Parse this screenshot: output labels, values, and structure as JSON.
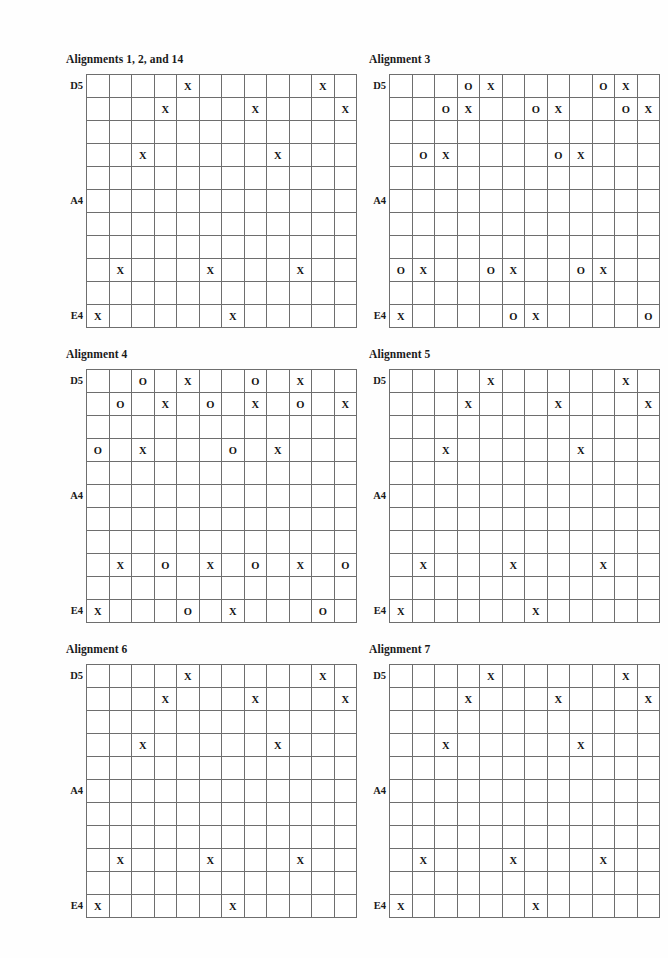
{
  "page": {
    "background_color": "#fefefe",
    "grid_line_color": "#6e6e6e",
    "text_color": "#131313",
    "columns": 12,
    "rows": 11
  },
  "row_labels": [
    {
      "text": "D5",
      "row": 0
    },
    {
      "text": "A4",
      "row": 5
    },
    {
      "text": "E4",
      "row": 10
    }
  ],
  "panels": [
    {
      "title": "Alignments 1, 2, and 14",
      "cells": [
        [
          "",
          "",
          "",
          "",
          "X",
          "",
          "",
          "",
          "",
          "",
          "X",
          ""
        ],
        [
          "",
          "",
          "",
          "X",
          "",
          "",
          "",
          "X",
          "",
          "",
          "",
          "X"
        ],
        [
          "",
          "",
          "",
          "",
          "",
          "",
          "",
          "",
          "",
          "",
          "",
          ""
        ],
        [
          "",
          "",
          "X",
          "",
          "",
          "",
          "",
          "",
          "X",
          "",
          "",
          ""
        ],
        [
          "",
          "",
          "",
          "",
          "",
          "",
          "",
          "",
          "",
          "",
          "",
          ""
        ],
        [
          "",
          "",
          "",
          "",
          "",
          "",
          "",
          "",
          "",
          "",
          "",
          ""
        ],
        [
          "",
          "",
          "",
          "",
          "",
          "",
          "",
          "",
          "",
          "",
          "",
          ""
        ],
        [
          "",
          "",
          "",
          "",
          "",
          "",
          "",
          "",
          "",
          "",
          "",
          ""
        ],
        [
          "",
          "X",
          "",
          "",
          "",
          "X",
          "",
          "",
          "",
          "X",
          "",
          ""
        ],
        [
          "",
          "",
          "",
          "",
          "",
          "",
          "",
          "",
          "",
          "",
          "",
          ""
        ],
        [
          "X",
          "",
          "",
          "",
          "",
          "",
          "X",
          "",
          "",
          "",
          "",
          ""
        ]
      ]
    },
    {
      "title": "Alignment 3",
      "cells": [
        [
          "",
          "",
          "",
          "O",
          "X",
          "",
          "",
          "",
          "",
          "O",
          "X",
          ""
        ],
        [
          "",
          "",
          "O",
          "X",
          "",
          "",
          "O",
          "X",
          "",
          "",
          "O",
          "X"
        ],
        [
          "",
          "",
          "",
          "",
          "",
          "",
          "",
          "",
          "",
          "",
          "",
          ""
        ],
        [
          "",
          "O",
          "X",
          "",
          "",
          "",
          "",
          "O",
          "X",
          "",
          "",
          ""
        ],
        [
          "",
          "",
          "",
          "",
          "",
          "",
          "",
          "",
          "",
          "",
          "",
          ""
        ],
        [
          "",
          "",
          "",
          "",
          "",
          "",
          "",
          "",
          "",
          "",
          "",
          ""
        ],
        [
          "",
          "",
          "",
          "",
          "",
          "",
          "",
          "",
          "",
          "",
          "",
          ""
        ],
        [
          "",
          "",
          "",
          "",
          "",
          "",
          "",
          "",
          "",
          "",
          "",
          ""
        ],
        [
          "O",
          "X",
          "",
          "",
          "O",
          "X",
          "",
          "",
          "O",
          "X",
          "",
          ""
        ],
        [
          "",
          "",
          "",
          "",
          "",
          "",
          "",
          "",
          "",
          "",
          "",
          ""
        ],
        [
          "X",
          "",
          "",
          "",
          "",
          "O",
          "X",
          "",
          "",
          "",
          "",
          "O"
        ]
      ]
    },
    {
      "title": "Alignment 4",
      "cells": [
        [
          "",
          "",
          "O",
          "",
          "X",
          "",
          "",
          "O",
          "",
          "X",
          "",
          ""
        ],
        [
          "",
          "O",
          "",
          "X",
          "",
          "O",
          "",
          "X",
          "",
          "O",
          "",
          "X"
        ],
        [
          "",
          "",
          "",
          "",
          "",
          "",
          "",
          "",
          "",
          "",
          "",
          ""
        ],
        [
          "O",
          "",
          "X",
          "",
          "",
          "",
          "O",
          "",
          "X",
          "",
          "",
          ""
        ],
        [
          "",
          "",
          "",
          "",
          "",
          "",
          "",
          "",
          "",
          "",
          "",
          ""
        ],
        [
          "",
          "",
          "",
          "",
          "",
          "",
          "",
          "",
          "",
          "",
          "",
          ""
        ],
        [
          "",
          "",
          "",
          "",
          "",
          "",
          "",
          "",
          "",
          "",
          "",
          ""
        ],
        [
          "",
          "",
          "",
          "",
          "",
          "",
          "",
          "",
          "",
          "",
          "",
          ""
        ],
        [
          "",
          "X",
          "",
          "O",
          "",
          "X",
          "",
          "O",
          "",
          "X",
          "",
          "O"
        ],
        [
          "",
          "",
          "",
          "",
          "",
          "",
          "",
          "",
          "",
          "",
          "",
          ""
        ],
        [
          "X",
          "",
          "",
          "",
          "O",
          "",
          "X",
          "",
          "",
          "",
          "O",
          ""
        ]
      ]
    },
    {
      "title": "Alignment 5",
      "cells": [
        [
          "",
          "",
          "",
          "",
          "X",
          "",
          "",
          "",
          "",
          "",
          "X",
          ""
        ],
        [
          "",
          "",
          "",
          "X",
          "",
          "",
          "",
          "X",
          "",
          "",
          "",
          "X"
        ],
        [
          "",
          "",
          "",
          "",
          "",
          "",
          "",
          "",
          "",
          "",
          "",
          ""
        ],
        [
          "",
          "",
          "X",
          "",
          "",
          "",
          "",
          "",
          "X",
          "",
          "",
          ""
        ],
        [
          "",
          "",
          "",
          "",
          "",
          "",
          "",
          "",
          "",
          "",
          "",
          ""
        ],
        [
          "",
          "",
          "",
          "",
          "",
          "",
          "",
          "",
          "",
          "",
          "",
          ""
        ],
        [
          "",
          "",
          "",
          "",
          "",
          "",
          "",
          "",
          "",
          "",
          "",
          ""
        ],
        [
          "",
          "",
          "",
          "",
          "",
          "",
          "",
          "",
          "",
          "",
          "",
          ""
        ],
        [
          "",
          "X",
          "",
          "",
          "",
          "X",
          "",
          "",
          "",
          "X",
          "",
          ""
        ],
        [
          "",
          "",
          "",
          "",
          "",
          "",
          "",
          "",
          "",
          "",
          "",
          ""
        ],
        [
          "X",
          "",
          "",
          "",
          "",
          "",
          "X",
          "",
          "",
          "",
          "",
          ""
        ]
      ]
    },
    {
      "title": "Alignment 6",
      "cells": [
        [
          "",
          "",
          "",
          "",
          "X",
          "",
          "",
          "",
          "",
          "",
          "X",
          ""
        ],
        [
          "",
          "",
          "",
          "X",
          "",
          "",
          "",
          "X",
          "",
          "",
          "",
          "X"
        ],
        [
          "",
          "",
          "",
          "",
          "",
          "",
          "",
          "",
          "",
          "",
          "",
          ""
        ],
        [
          "",
          "",
          "X",
          "",
          "",
          "",
          "",
          "",
          "X",
          "",
          "",
          ""
        ],
        [
          "",
          "",
          "",
          "",
          "",
          "",
          "",
          "",
          "",
          "",
          "",
          ""
        ],
        [
          "",
          "",
          "",
          "",
          "",
          "",
          "",
          "",
          "",
          "",
          "",
          ""
        ],
        [
          "",
          "",
          "",
          "",
          "",
          "",
          "",
          "",
          "",
          "",
          "",
          ""
        ],
        [
          "",
          "",
          "",
          "",
          "",
          "",
          "",
          "",
          "",
          "",
          "",
          ""
        ],
        [
          "",
          "X",
          "",
          "",
          "",
          "X",
          "",
          "",
          "",
          "X",
          "",
          ""
        ],
        [
          "",
          "",
          "",
          "",
          "",
          "",
          "",
          "",
          "",
          "",
          "",
          ""
        ],
        [
          "X",
          "",
          "",
          "",
          "",
          "",
          "X",
          "",
          "",
          "",
          "",
          ""
        ]
      ]
    },
    {
      "title": "Alignment 7",
      "cells": [
        [
          "",
          "",
          "",
          "",
          "X",
          "",
          "",
          "",
          "",
          "",
          "X",
          ""
        ],
        [
          "",
          "",
          "",
          "X",
          "",
          "",
          "",
          "X",
          "",
          "",
          "",
          "X"
        ],
        [
          "",
          "",
          "",
          "",
          "",
          "",
          "",
          "",
          "",
          "",
          "",
          ""
        ],
        [
          "",
          "",
          "X",
          "",
          "",
          "",
          "",
          "",
          "X",
          "",
          "",
          ""
        ],
        [
          "",
          "",
          "",
          "",
          "",
          "",
          "",
          "",
          "",
          "",
          "",
          ""
        ],
        [
          "",
          "",
          "",
          "",
          "",
          "",
          "",
          "",
          "",
          "",
          "",
          ""
        ],
        [
          "",
          "",
          "",
          "",
          "",
          "",
          "",
          "",
          "",
          "",
          "",
          ""
        ],
        [
          "",
          "",
          "",
          "",
          "",
          "",
          "",
          "",
          "",
          "",
          "",
          ""
        ],
        [
          "",
          "X",
          "",
          "",
          "",
          "X",
          "",
          "",
          "",
          "X",
          "",
          ""
        ],
        [
          "",
          "",
          "",
          "",
          "",
          "",
          "",
          "",
          "",
          "",
          "",
          ""
        ],
        [
          "X",
          "",
          "",
          "",
          "",
          "",
          "X",
          "",
          "",
          "",
          "",
          ""
        ]
      ]
    }
  ]
}
